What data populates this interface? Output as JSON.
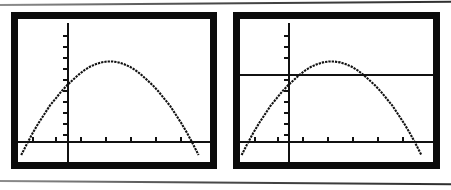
{
  "figure": {
    "background_color": "#ffffff",
    "ink_color": "#111111",
    "bezel_color": "#0b0b0b",
    "rule_color": "#4a4a4a",
    "top_rule_label": "page-rule-top",
    "bottom_rule_label": "page-rule-bottom"
  },
  "screens": [
    {
      "id": "left",
      "name": "calculator-screen-left",
      "caption": "Parabola only",
      "geometry": {
        "bezel": {
          "x": 11,
          "y": 12,
          "w": 206,
          "h": 157
        },
        "screen": {
          "x": 18,
          "y": 19,
          "w": 192,
          "h": 143
        }
      },
      "axes": {
        "x_axis_y": 122,
        "y_axis_x": 49,
        "x_ticks": [
          14,
          37,
          62,
          87,
          112,
          137,
          162
        ],
        "y_ticks": [
          16,
          27,
          38,
          49,
          60,
          71,
          82,
          93,
          104,
          115
        ]
      },
      "chart_data": {
        "type": "line",
        "title": "Quadratic y = a(x-h)^2 + k",
        "xlabel": "x",
        "ylabel": "y",
        "grid": false,
        "legend": "none",
        "xlim": [
          -4,
          10
        ],
        "ylim": [
          -2,
          12
        ],
        "series": [
          {
            "name": "parabola",
            "style": "dotted-pixel",
            "x": [
              -3.2,
              -2.8,
              -2.4,
              -2.0,
              -1.6,
              -1.2,
              -0.8,
              -0.4,
              0.0,
              0.4,
              0.8,
              1.2,
              1.6,
              2.0,
              2.4,
              2.8,
              3.0,
              3.2,
              3.6,
              4.0,
              4.4,
              4.8,
              5.2,
              5.6,
              6.0,
              6.4,
              6.8,
              7.2,
              7.6,
              8.0,
              8.4,
              8.8,
              9.2
            ],
            "y": [
              -1.6,
              -0.3,
              0.9,
              2.0,
              3.0,
              4.0,
              4.8,
              5.6,
              6.3,
              6.9,
              7.5,
              8.0,
              8.4,
              8.7,
              8.9,
              9.0,
              9.0,
              9.0,
              8.9,
              8.7,
              8.4,
              8.0,
              7.5,
              6.9,
              6.3,
              5.6,
              4.8,
              4.0,
              3.0,
              2.0,
              0.9,
              -0.3,
              -1.6
            ]
          }
        ],
        "annotations": []
      }
    },
    {
      "id": "right",
      "name": "calculator-screen-right",
      "caption": "Parabola with horizontal line",
      "geometry": {
        "bezel": {
          "x": 233,
          "y": 12,
          "w": 207,
          "h": 157
        },
        "screen": {
          "x": 240,
          "y": 19,
          "w": 193,
          "h": 143
        }
      },
      "axes": {
        "x_axis_y": 122,
        "y_axis_x": 48,
        "x_ticks": [
          14,
          37,
          62,
          87,
          112,
          137,
          162
        ],
        "y_ticks": [
          16,
          27,
          38,
          49,
          60,
          71,
          82,
          93,
          104,
          115
        ]
      },
      "chart_data": {
        "type": "line",
        "title": "Quadratic with horizontal intersecting line",
        "xlabel": "x",
        "ylabel": "y",
        "grid": false,
        "legend": "none",
        "xlim": [
          -4,
          10
        ],
        "ylim": [
          -2,
          12
        ],
        "series": [
          {
            "name": "parabola",
            "style": "dotted-pixel",
            "x": [
              -3.2,
              -2.8,
              -2.4,
              -2.0,
              -1.6,
              -1.2,
              -0.8,
              -0.4,
              0.0,
              0.4,
              0.8,
              1.2,
              1.6,
              2.0,
              2.4,
              2.8,
              3.0,
              3.2,
              3.6,
              4.0,
              4.4,
              4.8,
              5.2,
              5.6,
              6.0,
              6.4,
              6.8,
              7.2,
              7.6,
              8.0,
              8.4,
              8.8,
              9.2
            ],
            "y": [
              -1.6,
              -0.3,
              0.9,
              2.0,
              3.0,
              4.0,
              4.8,
              5.6,
              6.3,
              6.9,
              7.5,
              8.0,
              8.4,
              8.7,
              8.9,
              9.0,
              9.0,
              9.0,
              8.9,
              8.7,
              8.4,
              8.0,
              7.5,
              6.9,
              6.3,
              5.6,
              4.8,
              4.0,
              3.0,
              2.0,
              0.9,
              -0.3,
              -1.6
            ]
          },
          {
            "name": "horizontal-line",
            "style": "solid",
            "y_value": 7.6,
            "spans_full_width": true
          }
        ],
        "intersections": [
          {
            "x": 1.35,
            "y": 7.6
          },
          {
            "x": 4.7,
            "y": 7.6
          }
        ],
        "annotations": []
      }
    }
  ]
}
